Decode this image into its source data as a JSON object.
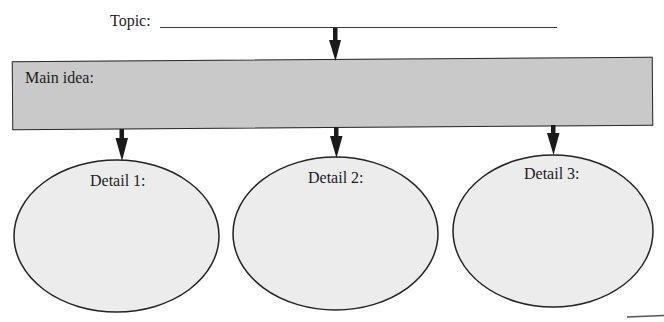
{
  "diagram": {
    "type": "main-idea-graphic-organizer",
    "topic": {
      "label": "Topic:",
      "value": ""
    },
    "main_idea": {
      "label": "Main idea:",
      "value": ""
    },
    "details": [
      {
        "label": "Detail 1:",
        "value": ""
      },
      {
        "label": "Detail 2:",
        "value": ""
      },
      {
        "label": "Detail 3:",
        "value": ""
      }
    ],
    "colors": {
      "main_box_fill": "#c9c9c9",
      "ellipse_fill": "#ececec",
      "stroke": "#222222",
      "arrow": "#1a1a1a"
    },
    "connections": [
      {
        "from": "topic",
        "to": "main_idea"
      },
      {
        "from": "main_idea",
        "to": "detail_1"
      },
      {
        "from": "main_idea",
        "to": "detail_2"
      },
      {
        "from": "main_idea",
        "to": "detail_3"
      }
    ]
  }
}
